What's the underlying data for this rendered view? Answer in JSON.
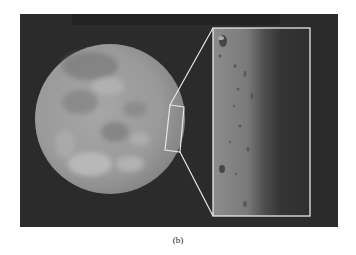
{
  "figure": {
    "colors": {
      "background": "#2b2b2b",
      "disk": "#9a9a9a",
      "highlight": "#c4c4c4",
      "shadow": "#7d7d7d",
      "outline": "#e6e6e6"
    }
  },
  "caption": {
    "label": "(b)"
  }
}
